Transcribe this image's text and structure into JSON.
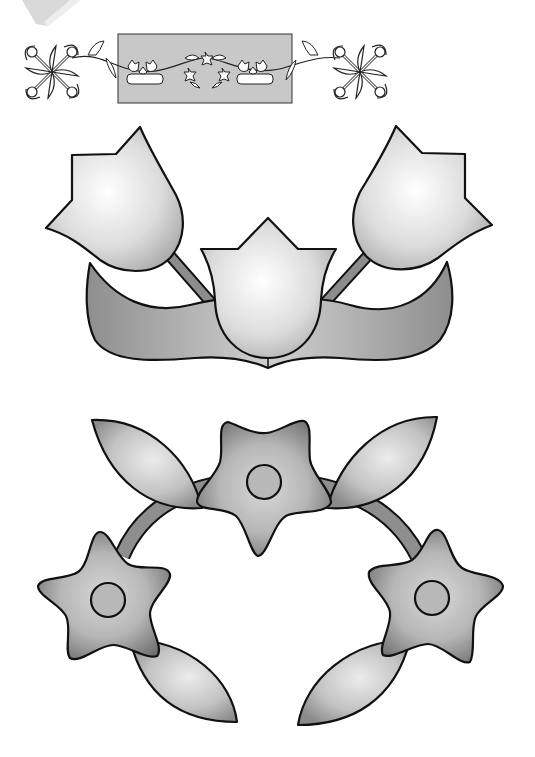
{
  "page": {
    "type": "applique-pattern-template",
    "background": "#ffffff"
  },
  "header_preview": {
    "highlight_box": {
      "x": 118,
      "y": 34,
      "width": 174,
      "height": 69,
      "fill": "#c8c8c8"
    },
    "corner_blocks": [
      "left-celtic-knot-block",
      "right-celtic-knot-block"
    ],
    "border_motifs": [
      "tulip-group",
      "tulip-group",
      "star-flower-arc",
      "tulip-group",
      "tulip-group"
    ]
  },
  "motifs": {
    "tulip_group": {
      "label": "tulip-group",
      "tulips": [
        {
          "name": "left-tulip"
        },
        {
          "name": "center-tulip"
        },
        {
          "name": "right-tulip"
        }
      ],
      "leaf_banner": {
        "name": "leaf-banner"
      },
      "stems": 2
    },
    "flower_arc": {
      "label": "star-flower-arc",
      "flowers": [
        {
          "name": "left-star-flower",
          "center": [
            108,
            600
          ]
        },
        {
          "name": "center-star-flower",
          "center": [
            264,
            482
          ]
        },
        {
          "name": "right-star-flower",
          "center": [
            432,
            598
          ]
        }
      ],
      "leaves": 4
    }
  },
  "colors": {
    "outline": "#111111",
    "light_fill": "#f4f4f4",
    "mid_fill": "#b4b4b4",
    "dark_fill": "#8a8a8a",
    "stem": "#8c8c8c",
    "preview_box": "#c8c8c8"
  }
}
